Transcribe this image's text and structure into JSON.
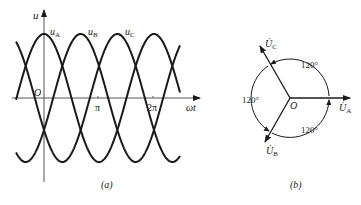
{
  "figure_a": {
    "caption": "(a)",
    "y_axis_label": "u",
    "x_axis_label": "ωt",
    "origin_label": "O",
    "ticks": [
      {
        "label": "π",
        "value": 3.14159
      },
      {
        "label": "2π",
        "value": 6.28318
      }
    ],
    "curves": [
      {
        "name": "uA",
        "label_main": "u",
        "label_sub": "A",
        "phase_deg": 0
      },
      {
        "name": "uB",
        "label_main": "u",
        "label_sub": "B",
        "phase_deg": -120
      },
      {
        "name": "uC",
        "label_main": "u",
        "label_sub": "C",
        "phase_deg": 120
      }
    ],
    "stroke_color": "#1a1a1a"
  },
  "figure_b": {
    "caption": "(b)",
    "origin_label": "O",
    "phasors": [
      {
        "name": "UA",
        "label_main": "U̇",
        "label_sub": "A",
        "angle_deg": 0
      },
      {
        "name": "UB",
        "label_main": "U̇",
        "label_sub": "B",
        "angle_deg": -120
      },
      {
        "name": "UC",
        "label_main": "U̇",
        "label_sub": "C",
        "angle_deg": 120
      }
    ],
    "angle_labels": [
      "120°",
      "120°",
      "120°"
    ],
    "stroke_color": "#1a1a1a"
  }
}
